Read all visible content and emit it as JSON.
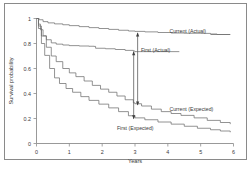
{
  "figure": {
    "background_color": "#ffffff",
    "border_color": "#8a8a8a",
    "line_color": "#6f6f6f"
  },
  "chart_data": {
    "type": "line",
    "title": "",
    "subtitle": "",
    "xlabel": "Years",
    "ylabel": "Survival probability",
    "xlim": [
      0,
      6
    ],
    "ylim": [
      0,
      1
    ],
    "xticks": [
      0,
      1,
      2,
      3,
      4,
      5,
      6
    ],
    "xticklabels": [
      "0",
      "1",
      "2",
      "3",
      "4",
      "5",
      "6"
    ],
    "yticks": [
      0,
      0.2,
      0.4,
      0.6,
      0.8,
      1
    ],
    "yticklabels": [
      "0",
      "0.2",
      "0.4",
      "0.6",
      "0.8",
      "1"
    ],
    "grid": false,
    "legend_position": "inline-annotations",
    "series": [
      {
        "name": "Current (Actual)",
        "label": "Current (Actual)",
        "label_x": 4.05,
        "label_y": 0.895,
        "x": [
          0,
          0.08,
          0.2,
          0.35,
          0.55,
          0.8,
          1.0,
          1.3,
          1.6,
          1.9,
          2.2,
          2.5,
          2.8,
          3.0,
          3.3,
          3.7,
          4.1,
          4.5,
          5.0,
          5.3,
          5.5,
          5.9
        ],
        "y": [
          1.0,
          0.99,
          0.975,
          0.965,
          0.957,
          0.95,
          0.943,
          0.935,
          0.927,
          0.92,
          0.913,
          0.906,
          0.9,
          0.897,
          0.893,
          0.888,
          0.884,
          0.882,
          0.881,
          0.876,
          0.872,
          0.872
        ]
      },
      {
        "name": "First (Actual)",
        "label": "First (Actual)",
        "label_x": 3.18,
        "label_y": 0.745,
        "x": [
          0,
          0.06,
          0.12,
          0.2,
          0.3,
          0.45,
          0.6,
          0.8,
          1.0,
          1.3,
          1.6,
          1.75,
          1.8,
          2.1,
          2.4,
          2.7,
          2.95,
          3.0
        ],
        "y": [
          1.0,
          0.955,
          0.91,
          0.862,
          0.83,
          0.805,
          0.795,
          0.788,
          0.783,
          0.78,
          0.778,
          0.777,
          0.762,
          0.758,
          0.752,
          0.745,
          0.74,
          0.735
        ]
      },
      {
        "name": "Current (Expected)",
        "label": "Current (Expected)",
        "label_x": 4.05,
        "label_y": 0.275,
        "x": [
          0,
          0.06,
          0.15,
          0.3,
          0.45,
          0.6,
          0.8,
          1.0,
          1.2,
          1.45,
          1.7,
          1.95,
          2.2,
          2.45,
          2.7,
          2.95,
          3.0,
          3.2,
          3.5,
          3.8,
          4.1,
          4.4,
          4.8,
          5.2,
          5.6,
          5.9
        ],
        "y": [
          1.0,
          0.94,
          0.86,
          0.77,
          0.7,
          0.655,
          0.6,
          0.565,
          0.535,
          0.5,
          0.465,
          0.435,
          0.41,
          0.38,
          0.35,
          0.325,
          0.318,
          0.3,
          0.275,
          0.255,
          0.24,
          0.225,
          0.205,
          0.185,
          0.168,
          0.155
        ]
      },
      {
        "name": "First (Expected)",
        "label": "First (Expected)",
        "label_x": 2.45,
        "label_y": 0.125,
        "x": [
          0,
          0.06,
          0.15,
          0.25,
          0.4,
          0.55,
          0.7,
          0.9,
          1.1,
          1.35,
          1.6,
          1.9,
          2.2,
          2.5,
          2.8,
          3.0,
          3.3,
          3.7,
          4.1,
          4.5,
          4.9,
          5.3,
          5.6,
          5.9
        ],
        "y": [
          1.0,
          0.92,
          0.8,
          0.705,
          0.6,
          0.525,
          0.48,
          0.44,
          0.41,
          0.375,
          0.345,
          0.315,
          0.285,
          0.255,
          0.222,
          0.205,
          0.19,
          0.172,
          0.155,
          0.138,
          0.122,
          0.11,
          0.1,
          0.09
        ]
      }
    ],
    "annotations": [
      {
        "name": "current-gap-arrow",
        "kind": "double-headed-vertical-arrow",
        "x": 3.08,
        "y_bottom": 0.308,
        "y_top": 0.885,
        "description": "Gap between Current (Expected) and Current (Actual) at 3 years"
      },
      {
        "name": "first-gap-arrow",
        "kind": "double-headed-vertical-arrow",
        "x": 2.96,
        "y_bottom": 0.198,
        "y_top": 0.735,
        "description": "Gap between First (Expected) and First (Actual) at 3 years"
      }
    ],
    "leaders": [
      {
        "name": "current-actual-leader",
        "from_x": 5.3,
        "from_y": 0.872,
        "to_x": 5.9,
        "to_y": 0.872
      },
      {
        "name": "first-actual-leader",
        "from_x": 3.0,
        "from_y": 0.735,
        "to_x": 4.35,
        "to_y": 0.735
      }
    ]
  }
}
